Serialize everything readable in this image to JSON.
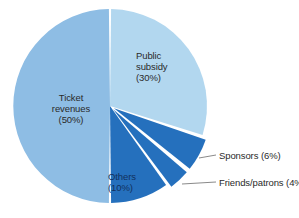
{
  "chart_data": {
    "type": "pie",
    "title": "",
    "subtitle": "",
    "xlabel": "",
    "ylabel": "",
    "legend_position": "none",
    "grid": false,
    "units": "percent",
    "total": 100,
    "categories": [
      "Ticket revenues",
      "Public subsidy",
      "Sponsors",
      "Friends/patrons",
      "Others"
    ],
    "values": [
      50,
      30,
      6,
      4,
      10
    ],
    "slices": [
      {
        "name": "ticket-revenues",
        "label": "Ticket",
        "label_line2": "revenues",
        "percent_text": "(50%)",
        "value": 50,
        "color": "#8ebde4",
        "start_angle_deg": 180,
        "end_angle_deg": 360,
        "exploded": false,
        "label_inside": true
      },
      {
        "name": "public-subsidy",
        "label": "Public",
        "label_line2": "subsidy",
        "percent_text": "(30%)",
        "value": 30,
        "color": "#b2d7ef",
        "start_angle_deg": 0,
        "end_angle_deg": 108,
        "exploded": false,
        "label_inside": true
      },
      {
        "name": "sponsors",
        "label": "Sponsors",
        "label_line2": "",
        "percent_text": "(6%)",
        "value": 6,
        "color": "#2570bd",
        "start_angle_deg": 108,
        "end_angle_deg": 129.6,
        "exploded": true,
        "label_inside": false
      },
      {
        "name": "friends-patrons",
        "label": "Friends/patrons",
        "label_line2": "",
        "percent_text": "(4%)",
        "value": 4,
        "color": "#2570bd",
        "start_angle_deg": 129.6,
        "end_angle_deg": 144,
        "exploded": true,
        "label_inside": false
      },
      {
        "name": "others",
        "label": "Others",
        "label_line2": "",
        "percent_text": "(10%)",
        "value": 10,
        "color": "#2570bd",
        "start_angle_deg": 144,
        "end_angle_deg": 180,
        "exploded": false,
        "label_inside": true
      }
    ],
    "colors": {
      "ticket_revenues": "#8ebde4",
      "public_subsidy": "#b2d7ef",
      "dark_slices": "#2570bd",
      "background": "#ffffff",
      "text": "#2a2a2a",
      "leader_line": "#8a8a8a",
      "slice_gap": "#ffffff"
    }
  },
  "labels": {
    "ticket": {
      "line1": "Ticket",
      "line2": "revenues",
      "percent": "(50%)"
    },
    "subsidy": {
      "line1": "Public",
      "line2": "subsidy",
      "percent": "(30%)"
    },
    "others": {
      "line1": "Others",
      "percent": "(10%)"
    },
    "sponsors": {
      "line1": "Sponsors",
      "percent": "(6%)"
    },
    "friends": {
      "line1": "Friends/patrons",
      "percent": "(4%)"
    }
  }
}
